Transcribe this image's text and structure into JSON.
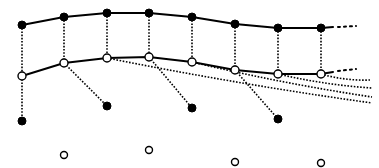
{
  "diagram": {
    "colors": {
      "ink": "#000000",
      "background": "#ffffff"
    },
    "top_row": {
      "style": "filled",
      "nodes": [
        [
          22,
          25
        ],
        [
          64,
          17
        ],
        [
          107,
          13
        ],
        [
          149,
          13
        ],
        [
          192,
          17
        ],
        [
          235,
          24
        ],
        [
          278,
          28
        ],
        [
          321,
          28
        ]
      ],
      "continuation": "dotted-right"
    },
    "middle_row": {
      "style": "open",
      "nodes": [
        [
          22,
          76
        ],
        [
          64,
          63
        ],
        [
          107,
          58
        ],
        [
          149,
          57
        ],
        [
          192,
          62
        ],
        [
          235,
          70
        ],
        [
          278,
          74
        ],
        [
          321,
          74
        ]
      ],
      "continuation": "dotted-right"
    },
    "bottom_filled_nodes": [
      [
        22,
        121
      ],
      [
        107,
        106
      ],
      [
        192,
        108
      ],
      [
        278,
        119
      ]
    ],
    "bottom_open_nodes": [
      [
        64,
        155
      ],
      [
        149,
        150
      ],
      [
        235,
        162
      ],
      [
        321,
        163
      ]
    ],
    "branches": [
      {
        "from": [
          22,
          76
        ],
        "to": [
          22,
          121
        ]
      },
      {
        "from": [
          64,
          63
        ],
        "to": [
          107,
          106
        ]
      },
      {
        "from": [
          149,
          57
        ],
        "to": [
          192,
          108
        ]
      },
      {
        "from": [
          235,
          70
        ],
        "to": [
          278,
          119
        ]
      }
    ],
    "trailing_lines": [
      {
        "from": [
          107,
          58
        ],
        "to": [
          372,
          103
        ]
      },
      {
        "from": [
          192,
          62
        ],
        "to": [
          372,
          97
        ]
      },
      {
        "from": [
          278,
          74
        ],
        "to": [
          372,
          88
        ]
      },
      {
        "from": [
          321,
          74
        ],
        "to": [
          370,
          80
        ]
      }
    ]
  }
}
